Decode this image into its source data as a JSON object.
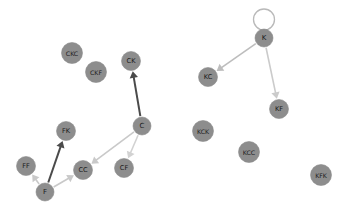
{
  "figure": {
    "kind": "directed-graph",
    "background_color": "#ffffff",
    "width": 343,
    "height": 215
  },
  "style": {
    "node_fill": "#8d8d8d",
    "node_stroke": "#8c8c8c",
    "node_label_color": "#1a1a1a",
    "edge_light_color": "#c9c9c9",
    "edge_dark_color": "#4a4a4a",
    "loop_color": "#b9b9b9"
  },
  "chart_data": {
    "type": "graph",
    "title": "",
    "directed": true,
    "nodes": [
      {
        "id": "CKC",
        "label": "CKC",
        "x": 72,
        "y": 53,
        "r": 10.5,
        "font_size": 6.2
      },
      {
        "id": "CKF",
        "label": "CKF",
        "x": 96,
        "y": 72,
        "r": 10.5,
        "font_size": 6.2
      },
      {
        "id": "CK",
        "label": "CK",
        "x": 131,
        "y": 61,
        "r": 9.5,
        "font_size": 6.6
      },
      {
        "id": "C",
        "label": "C",
        "x": 142,
        "y": 126,
        "r": 9.0,
        "font_size": 7.0
      },
      {
        "id": "FK",
        "label": "FK",
        "x": 66,
        "y": 131,
        "r": 9.5,
        "font_size": 6.6
      },
      {
        "id": "FF",
        "label": "FF",
        "x": 26,
        "y": 166,
        "r": 9.5,
        "font_size": 6.6
      },
      {
        "id": "CC",
        "label": "CC",
        "x": 83,
        "y": 170,
        "r": 9.5,
        "font_size": 6.6
      },
      {
        "id": "CF",
        "label": "CF",
        "x": 124,
        "y": 168,
        "r": 9.5,
        "font_size": 6.6
      },
      {
        "id": "F",
        "label": "F",
        "x": 45,
        "y": 192,
        "r": 9.0,
        "font_size": 7.0
      },
      {
        "id": "K",
        "label": "K",
        "x": 264,
        "y": 38,
        "r": 9.0,
        "font_size": 7.0
      },
      {
        "id": "KC",
        "label": "KC",
        "x": 208,
        "y": 77,
        "r": 9.5,
        "font_size": 6.6
      },
      {
        "id": "KF",
        "label": "KF",
        "x": 279,
        "y": 109,
        "r": 9.5,
        "font_size": 6.6
      },
      {
        "id": "KCK",
        "label": "KCK",
        "x": 203,
        "y": 131,
        "r": 10.5,
        "font_size": 6.2
      },
      {
        "id": "KCC",
        "label": "KCC",
        "x": 249,
        "y": 152,
        "r": 10.5,
        "font_size": 6.2
      },
      {
        "id": "KFK",
        "label": "KFK",
        "x": 321,
        "y": 175,
        "r": 10.5,
        "font_size": 6.2
      }
    ],
    "edges": [
      {
        "source": "C",
        "target": "CK",
        "color": "#4a4a4a",
        "width": 2.0,
        "shade": "dark"
      },
      {
        "source": "C",
        "target": "CC",
        "color": "#c9c9c9",
        "width": 1.6,
        "shade": "light"
      },
      {
        "source": "C",
        "target": "CF",
        "color": "#d2d2d2",
        "width": 1.6,
        "shade": "light"
      },
      {
        "source": "F",
        "target": "FK",
        "color": "#4a4a4a",
        "width": 2.0,
        "shade": "dark"
      },
      {
        "source": "F",
        "target": "FF",
        "color": "#c9c9c9",
        "width": 1.6,
        "shade": "light"
      },
      {
        "source": "F",
        "target": "CC",
        "color": "#c9c9c9",
        "width": 1.6,
        "shade": "light"
      },
      {
        "source": "K",
        "target": "KC",
        "color": "#bdbdbd",
        "width": 1.6,
        "shade": "light"
      },
      {
        "source": "K",
        "target": "KF",
        "color": "#cbcbcb",
        "width": 1.6,
        "shade": "light"
      },
      {
        "source": "K",
        "target": "K",
        "color": "#b9b9b9",
        "width": 1.3,
        "shade": "light",
        "self_loop": true,
        "loop_r": 10.5,
        "loop_dx": 0,
        "loop_dy": -12
      }
    ],
    "isolated_nodes": [
      "CKC",
      "CKF",
      "KCK",
      "KCC",
      "KFK"
    ],
    "legend": [],
    "xlabel": "",
    "ylabel": ""
  }
}
